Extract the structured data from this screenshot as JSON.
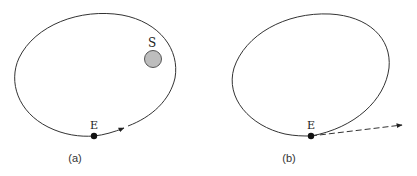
{
  "figure": {
    "panels": [
      {
        "id": "a",
        "caption": "(a)",
        "body_label": "E",
        "sun_label": "S",
        "description": "Closed elliptical orbit of E around S, velocity arrow tangent to orbit"
      },
      {
        "id": "b",
        "caption": "(b)",
        "body_label": "E",
        "description": "Orbit with E leaving along a dashed tangent line (escape trajectory)"
      }
    ],
    "colors": {
      "line": "#333333",
      "body": "#111111",
      "sun_fill": "#bdbdbd",
      "sun_stroke": "#555555"
    }
  }
}
